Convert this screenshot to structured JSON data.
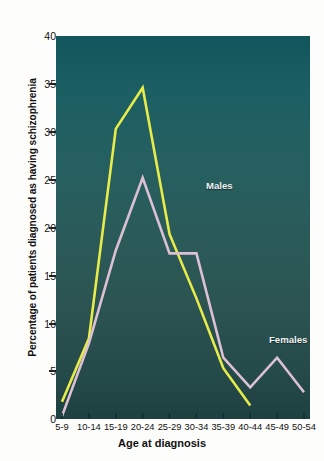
{
  "chart_data": {
    "type": "line",
    "title": "",
    "xlabel": "Age at diagnosis",
    "ylabel": "Percentage of patients diagnosed as having schizophrenia",
    "categories": [
      "5-9",
      "10-14",
      "15-19",
      "20-24",
      "25-29",
      "30-34",
      "35-39",
      "40-44",
      "45-49",
      "50-54"
    ],
    "ylim": [
      0,
      40
    ],
    "yticks": [
      0,
      5,
      10,
      15,
      20,
      25,
      30,
      35,
      40
    ],
    "grid": false,
    "legend_position": "inline-annotation",
    "series": [
      {
        "name": "Males",
        "color": "#e8ec4a",
        "values": [
          1.8,
          8.4,
          30.3,
          34.6,
          19.3,
          12.6,
          5.3,
          1.4,
          null,
          null
        ]
      },
      {
        "name": "Females",
        "color": "#dcc0d4",
        "values": [
          0.3,
          7.9,
          17.6,
          25.2,
          17.3,
          17.3,
          6.4,
          3.3,
          6.4,
          2.8
        ]
      }
    ],
    "annotations": [
      {
        "text": "Males",
        "x": "20-24",
        "y": 28.5
      },
      {
        "text": "Females",
        "x": "30-34",
        "y": 12.7
      }
    ]
  },
  "colors": {
    "males_line": "#e8ec4a",
    "females_line": "#dcc0d4",
    "plot_background_top": "#12555c",
    "plot_background_bottom": "#1d4140",
    "axis_text": "#111111",
    "annotation_text": "#eef2f2"
  }
}
